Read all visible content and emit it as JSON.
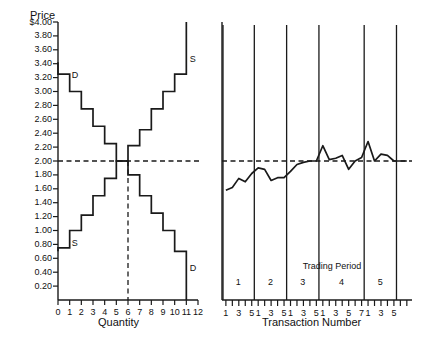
{
  "figure": {
    "background": "#ffffff",
    "ink": "#1a1a1a"
  },
  "left_panel": {
    "y_axis_title": "Price",
    "x_axis_title": "Quantity",
    "y_ticks": [
      "$4.00",
      "3.80",
      "3.60",
      "3.40",
      "3.20",
      "3.00",
      "2.80",
      "2.60",
      "2.40",
      "2.20",
      "2.00",
      "1.80",
      "1.60",
      "1.40",
      "1.20",
      "1.00",
      "0.80",
      "0.60",
      "0.40",
      "0.20"
    ],
    "x_ticks": [
      "0",
      "1",
      "2",
      "3",
      "4",
      "5",
      "6",
      "7",
      "8",
      "9",
      "10",
      "11",
      "12"
    ],
    "demand_label_top": "D",
    "demand_label_bottom": "D",
    "supply_label_top": "S",
    "supply_label_bottom": "S",
    "equilibrium_price": 2.0,
    "equilibrium_quantity": 6
  },
  "right_panel": {
    "x_axis_title": "Transaction Number",
    "period_group_title": "Trading Period",
    "period_labels": [
      "1",
      "2",
      "3",
      "4",
      "5"
    ],
    "transaction_tick_labels": [
      [
        "1",
        "",
        "3",
        "",
        "5"
      ],
      [
        "1",
        "",
        "3",
        "",
        "5"
      ],
      [
        "1",
        "",
        "3",
        "",
        "5"
      ],
      [
        "1",
        "",
        "3",
        "",
        "5",
        "",
        "7"
      ],
      [
        "1",
        "",
        "3",
        "",
        "5"
      ]
    ]
  },
  "chart_data": {
    "type": "line",
    "title": "",
    "subtitle": "",
    "panels": [
      {
        "name": "supply-demand-step-chart",
        "type": "line",
        "xlabel": "Quantity",
        "ylabel": "Price",
        "xlim": [
          0,
          12
        ],
        "ylim": [
          0,
          4.0
        ],
        "grid": false,
        "legend_position": "inline-annotations",
        "series": [
          {
            "name": "Demand",
            "label": "D",
            "style": "step",
            "comment": "Downward stepping demand schedule; each unit one quantity wide",
            "steps": [
              {
                "q_from": 0,
                "q_to": 1,
                "price": 3.25
              },
              {
                "q_from": 1,
                "q_to": 2,
                "price": 3.0
              },
              {
                "q_from": 2,
                "q_to": 3,
                "price": 2.75
              },
              {
                "q_from": 3,
                "q_to": 4,
                "price": 2.5
              },
              {
                "q_from": 4,
                "q_to": 5,
                "price": 2.25
              },
              {
                "q_from": 5,
                "q_to": 6,
                "price": 2.0
              },
              {
                "q_from": 6,
                "q_to": 7,
                "price": 1.8
              },
              {
                "q_from": 7,
                "q_to": 8,
                "price": 1.5
              },
              {
                "q_from": 8,
                "q_to": 9,
                "price": 1.25
              },
              {
                "q_from": 9,
                "q_to": 10,
                "price": 1.0
              },
              {
                "q_from": 10,
                "q_to": 11,
                "price": 0.7
              }
            ]
          },
          {
            "name": "Supply",
            "label": "S",
            "style": "step",
            "comment": "Upward stepping supply schedule; each unit one quantity wide",
            "steps": [
              {
                "q_from": 0,
                "q_to": 1,
                "price": 0.75
              },
              {
                "q_from": 1,
                "q_to": 2,
                "price": 1.0
              },
              {
                "q_from": 2,
                "q_to": 3,
                "price": 1.22
              },
              {
                "q_from": 3,
                "q_to": 4,
                "price": 1.5
              },
              {
                "q_from": 4,
                "q_to": 5,
                "price": 1.75
              },
              {
                "q_from": 5,
                "q_to": 6,
                "price": 2.0
              },
              {
                "q_from": 6,
                "q_to": 7,
                "price": 2.22
              },
              {
                "q_from": 7,
                "q_to": 8,
                "price": 2.45
              },
              {
                "q_from": 8,
                "q_to": 9,
                "price": 2.75
              },
              {
                "q_from": 9,
                "q_to": 10,
                "price": 3.0
              },
              {
                "q_from": 10,
                "q_to": 11,
                "price": 3.25
              }
            ]
          }
        ],
        "annotations": [
          {
            "text": "D",
            "q": 1.1,
            "price": 3.22
          },
          {
            "text": "D",
            "q": 11.2,
            "price": 0.45
          },
          {
            "text": "S",
            "q": 11.2,
            "price": 3.45
          },
          {
            "text": "S",
            "q": 1.1,
            "price": 0.8
          }
        ],
        "reference_lines": [
          {
            "orientation": "horizontal",
            "value": 2.0,
            "style": "dashed"
          },
          {
            "orientation": "vertical",
            "value": 6,
            "style": "dashed"
          }
        ]
      },
      {
        "name": "transaction-price-sequence",
        "type": "line",
        "xlabel": "Transaction Number",
        "ylabel": "",
        "ylim": [
          0,
          4.0
        ],
        "grid": false,
        "reference_lines": [
          {
            "orientation": "horizontal",
            "value": 2.0,
            "style": "dashed"
          }
        ],
        "period_dividers": [
          0,
          5,
          10,
          15,
          22,
          27
        ],
        "periods": [
          {
            "period": "1",
            "transactions": [
              1,
              2,
              3,
              4,
              5
            ],
            "prices": [
              1.58,
              1.62,
              1.75,
              1.7,
              1.82
            ]
          },
          {
            "period": "2",
            "transactions": [
              1,
              2,
              3,
              4,
              5
            ],
            "prices": [
              1.9,
              1.88,
              1.72,
              1.76,
              1.76
            ]
          },
          {
            "period": "3",
            "transactions": [
              1,
              2,
              3,
              4,
              5
            ],
            "prices": [
              1.85,
              1.95,
              1.98,
              2.0,
              2.0
            ]
          },
          {
            "period": "4",
            "transactions": [
              1,
              2,
              3,
              4,
              5,
              6,
              7
            ],
            "prices": [
              2.22,
              2.02,
              2.04,
              2.08,
              1.88,
              2.0,
              2.05
            ]
          },
          {
            "period": "5",
            "transactions": [
              1,
              2,
              3,
              4,
              5
            ],
            "prices": [
              2.28,
              2.0,
              2.1,
              2.08,
              2.0
            ]
          }
        ],
        "tail_prices": [
          2.0,
          2.0
        ]
      }
    ]
  }
}
